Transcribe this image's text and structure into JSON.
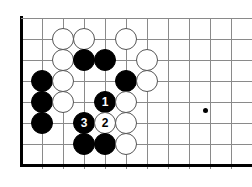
{
  "diagram": {
    "kind": "go-board-diagram",
    "board": {
      "origin_x": 21,
      "origin_y": 18,
      "spacing": 21,
      "cols": 11,
      "rows": 8,
      "line_color": "#8a8a8a",
      "border_color": "#000000",
      "border_width": 3,
      "line_width": 1,
      "background": "#ffffff"
    },
    "star_points": [
      {
        "name": "hoshi",
        "x": 205,
        "y": 110
      }
    ],
    "stone_radius": 11,
    "colors": {
      "black": "#000000",
      "white": "#ffffff",
      "white_outline": "#555555",
      "black_label": "#ffffff",
      "white_label": "#000000"
    },
    "stones": [
      {
        "id": "w-c3-r1",
        "color": "white",
        "x": 63,
        "y": 39,
        "label": ""
      },
      {
        "id": "w-c4-r1",
        "color": "white",
        "x": 84,
        "y": 39,
        "label": ""
      },
      {
        "id": "w-c6-r1",
        "color": "white",
        "x": 126,
        "y": 39,
        "label": ""
      },
      {
        "id": "w-c3-r2",
        "color": "white",
        "x": 63,
        "y": 60,
        "label": ""
      },
      {
        "id": "b-c4-r2",
        "color": "black",
        "x": 84,
        "y": 60,
        "label": ""
      },
      {
        "id": "b-c5-r2",
        "color": "black",
        "x": 105,
        "y": 60,
        "label": ""
      },
      {
        "id": "w-c7-r2",
        "color": "white",
        "x": 147,
        "y": 60,
        "label": ""
      },
      {
        "id": "b-c2-r3",
        "color": "black",
        "x": 42,
        "y": 81,
        "label": ""
      },
      {
        "id": "w-c3-r3",
        "color": "white",
        "x": 63,
        "y": 81,
        "label": ""
      },
      {
        "id": "b-c6-r3",
        "color": "black",
        "x": 126,
        "y": 81,
        "label": ""
      },
      {
        "id": "w-c7-r3",
        "color": "white",
        "x": 147,
        "y": 81,
        "label": ""
      },
      {
        "id": "b-c2-r4",
        "color": "black",
        "x": 42,
        "y": 102,
        "label": ""
      },
      {
        "id": "w-c3-r4",
        "color": "white",
        "x": 63,
        "y": 102,
        "label": ""
      },
      {
        "id": "b-move-1",
        "color": "black",
        "x": 105,
        "y": 102,
        "label": "1"
      },
      {
        "id": "w-c6-r4",
        "color": "white",
        "x": 126,
        "y": 102,
        "label": ""
      },
      {
        "id": "b-c2-r5",
        "color": "black",
        "x": 42,
        "y": 123,
        "label": ""
      },
      {
        "id": "b-move-3",
        "color": "black",
        "x": 84,
        "y": 123,
        "label": "3"
      },
      {
        "id": "w-move-2",
        "color": "white",
        "x": 105,
        "y": 123,
        "label": "2"
      },
      {
        "id": "w-c6-r5",
        "color": "white",
        "x": 126,
        "y": 123,
        "label": ""
      },
      {
        "id": "b-c4-r6",
        "color": "black",
        "x": 84,
        "y": 144,
        "label": ""
      },
      {
        "id": "b-c5-r6",
        "color": "black",
        "x": 105,
        "y": 144,
        "label": ""
      },
      {
        "id": "w-c6-r6",
        "color": "white",
        "x": 126,
        "y": 144,
        "label": ""
      }
    ],
    "move_labels": [
      "1",
      "2",
      "3"
    ]
  }
}
